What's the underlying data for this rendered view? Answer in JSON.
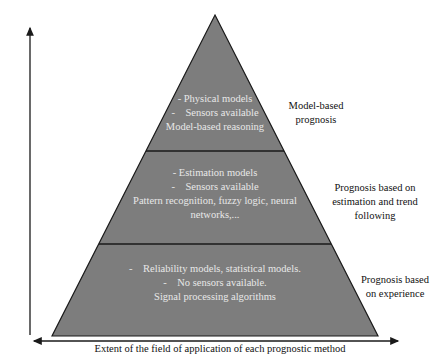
{
  "diagram": {
    "type": "pyramid",
    "colors": {
      "fill": "#7d7d7d",
      "stroke": "#1a1a1a",
      "tier_text": "#e8e8e8",
      "label_text": "#111111"
    },
    "y_axis_label": "Precision, complexity and cost",
    "x_axis_label": "Extent of the field of application of each prognostic method",
    "tiers": [
      {
        "lines": [
          "- Physical models",
          "-    Sensors available",
          "Model-based reasoning"
        ],
        "side_label": [
          "Model-based",
          "prognosis"
        ]
      },
      {
        "lines": [
          "- Estimation models",
          "-    Sensors available",
          "Pattern recognition, fuzzy logic, neural",
          "networks,..."
        ],
        "side_label": [
          "Prognosis based on",
          "estimation and trend",
          "following"
        ]
      },
      {
        "lines": [
          "-    Reliability models, statistical models.",
          "-    No sensors available.",
          "Signal processing algorithms"
        ],
        "side_label": [
          "Prognosis based",
          "on experience"
        ]
      }
    ]
  }
}
